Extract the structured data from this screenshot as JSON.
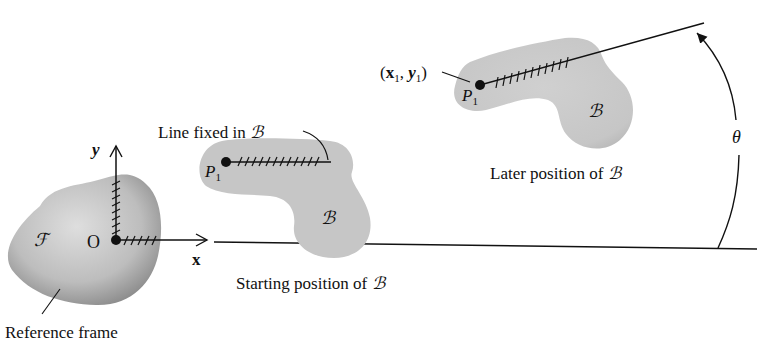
{
  "figure": {
    "type": "rigid-body-kinematics-diagram",
    "reference_frame": {
      "symbol": "ℱ",
      "origin_label": "O",
      "x_axis_label": "x",
      "y_axis_label": "y",
      "caption": "Reference frame"
    },
    "starting_body": {
      "symbol": "ℬ",
      "point_label": "P",
      "point_subscript": "1",
      "line_label_prefix": "Line fixed in ",
      "line_label_symbol": "ℬ",
      "caption_prefix": "Starting position of ",
      "caption_symbol": "ℬ"
    },
    "later_body": {
      "symbol": "ℬ",
      "point_label": "P",
      "point_subscript": "1",
      "coord_open": "(",
      "coord_x": "x",
      "coord_x_sub": "1",
      "coord_sep": ", ",
      "coord_y": "y",
      "coord_y_sub": "1",
      "coord_close": ")",
      "caption_prefix": "Later position of ",
      "caption_symbol": "ℬ"
    },
    "rotation": {
      "angle_label": "θ"
    },
    "colors": {
      "body_fill": "#c8c8c8",
      "frame_fill_light": "#d6d6d6",
      "frame_fill_dark": "#8e8e8e",
      "ink": "#111111"
    }
  }
}
